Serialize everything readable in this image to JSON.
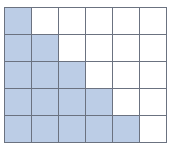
{
  "grid": {
    "columns": 6,
    "rows": 5,
    "shaded_color": "#bccde6",
    "empty_color": "#ffffff",
    "line_color": "#6b7280",
    "shaded_per_row": [
      1,
      2,
      3,
      4,
      5
    ],
    "total_cells": 30,
    "shaded_cells": 15
  }
}
